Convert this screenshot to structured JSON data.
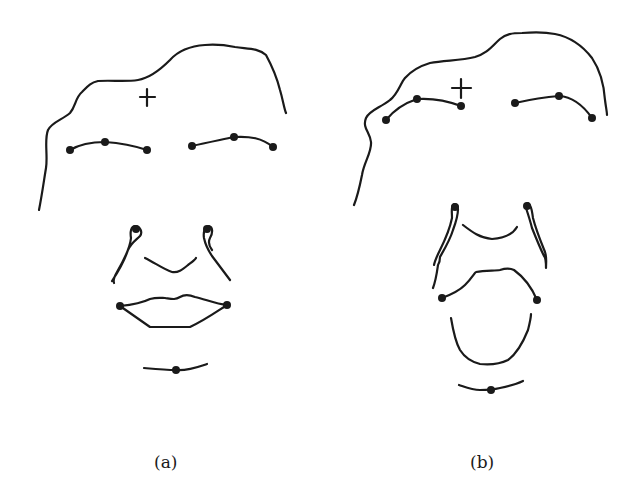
{
  "figure": {
    "panels": [
      {
        "label": "(a)",
        "description": "Neutral face sketch with facial landmark points",
        "stroke_color": "#1a1a1a",
        "landmarks": {
          "forehead_marker": "+",
          "left_brow_points": 3,
          "right_brow_points": 3,
          "nose_points": 2,
          "mouth_corner_points": 2,
          "chin_points": 1
        }
      },
      {
        "label": "(b)",
        "description": "Surprised face sketch with raised brows and open mouth",
        "stroke_color": "#1a1a1a",
        "landmarks": {
          "forehead_marker": "+",
          "left_brow_points": 3,
          "right_brow_points": 3,
          "nose_points": 2,
          "mouth_corner_points": 2,
          "chin_points": 1
        }
      }
    ]
  }
}
